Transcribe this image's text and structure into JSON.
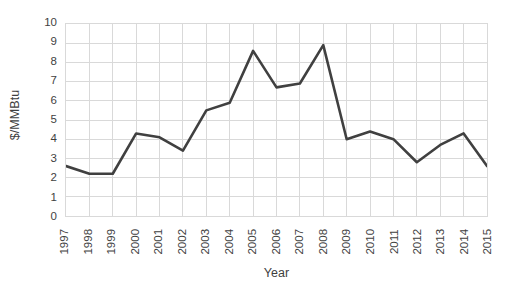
{
  "chart_data": {
    "type": "line",
    "title": "",
    "xlabel": "Year",
    "ylabel": "$/MMBtu",
    "categories": [
      "1997",
      "1998",
      "1999",
      "2000",
      "2001",
      "2002",
      "2003",
      "2004",
      "2005",
      "2006",
      "2007",
      "2008",
      "2009",
      "2010",
      "2011",
      "2012",
      "2013",
      "2014",
      "2015"
    ],
    "values": [
      2.6,
      2.2,
      2.2,
      4.3,
      4.1,
      3.4,
      5.5,
      5.9,
      8.6,
      6.7,
      6.9,
      8.9,
      4.0,
      4.4,
      4.0,
      2.8,
      3.7,
      4.3,
      2.6
    ],
    "series": [
      {
        "name": "$/MMBtu",
        "values": [
          2.6,
          2.2,
          2.2,
          4.3,
          4.1,
          3.4,
          5.5,
          5.9,
          8.6,
          6.7,
          6.9,
          8.9,
          4.0,
          4.4,
          4.0,
          2.8,
          3.7,
          4.3,
          2.6
        ]
      }
    ],
    "ylim": [
      0,
      10
    ],
    "yticks": [
      0,
      1,
      2,
      3,
      4,
      5,
      6,
      7,
      8,
      9,
      10
    ],
    "ytick_labels": [
      "0",
      "1",
      "2",
      "3",
      "4",
      "5",
      "6",
      "7",
      "8",
      "9",
      "10"
    ],
    "grid": "both",
    "legend": "none",
    "line_color": "#404040",
    "grid_color": "#d9d9d9",
    "plot_border_color": "#d9d9d9",
    "background_color": "#ffffff",
    "text_color": "#3f3f3f",
    "xtick_rotation": 90,
    "markers": "none"
  }
}
